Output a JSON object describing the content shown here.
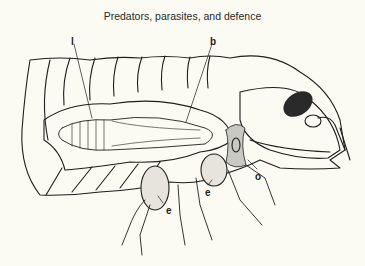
{
  "page": {
    "header_title": "Predators, parasites, and defence"
  },
  "figure": {
    "labels": [
      {
        "id": "l",
        "text": "l",
        "x": 71,
        "y": 36
      },
      {
        "id": "b",
        "text": "b",
        "x": 210,
        "y": 36
      },
      {
        "id": "e1",
        "text": "e",
        "x": 166,
        "y": 205
      },
      {
        "id": "e2",
        "text": "e",
        "x": 205,
        "y": 187
      },
      {
        "id": "o",
        "text": "o",
        "x": 255,
        "y": 171
      }
    ],
    "colors": {
      "background": "#fbfaf3",
      "ink": "#1e1e1e",
      "stipple": "#c9c9c4"
    }
  }
}
